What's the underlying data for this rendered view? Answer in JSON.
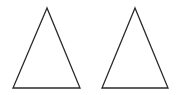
{
  "diagram": {
    "background": "#ffffff",
    "stroke_color": "#2a2a2a",
    "stroke_width": 1.3,
    "shapes": [
      {
        "type": "triangle",
        "label": "",
        "points": "47,8 13,88 80,88"
      },
      {
        "type": "triangle",
        "label": "",
        "points": "135,8 102,88 168,88"
      }
    ]
  }
}
